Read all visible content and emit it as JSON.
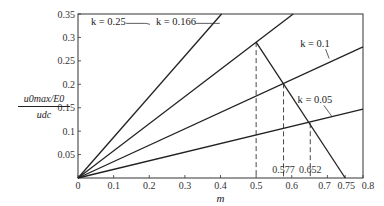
{
  "chart_data": {
    "type": "line",
    "title": "",
    "xlabel": "m",
    "ylabel": "u0max/E0 / udc",
    "ylabel_parts": {
      "numerator": "u0max/E0",
      "denominator": "udc"
    },
    "xlim": [
      0,
      0.8
    ],
    "ylim": [
      0,
      0.35
    ],
    "grid": false,
    "x_ticks": [
      0,
      0.1,
      0.2,
      0.3,
      0.4,
      0.5,
      0.6,
      0.7,
      0.75,
      0.8
    ],
    "x_tick_labels": [
      "0",
      "0.1",
      "0.2",
      "0.3",
      "0.4",
      "0.5",
      "0.6",
      "0.7",
      "0.75",
      "0.8"
    ],
    "y_ticks": [
      0.05,
      0.1,
      0.15,
      0.2,
      0.25,
      0.3,
      0.35
    ],
    "y_tick_labels": [
      "0.05",
      "0.1",
      "0.15",
      "0.2",
      "0.25",
      "0.3",
      "0.35"
    ],
    "series": [
      {
        "name": "k = 0.25",
        "x": [
          0,
          0.403
        ],
        "y": [
          0,
          0.35
        ],
        "label_pos": [
          0.17,
          0.33
        ]
      },
      {
        "name": "k = 0.166",
        "x": [
          0,
          0.604
        ],
        "y": [
          0,
          0.35
        ],
        "label_pos": [
          0.36,
          0.33
        ]
      },
      {
        "name": "k = 0.1",
        "x": [
          0,
          0.8
        ],
        "y": [
          0,
          0.28
        ],
        "label_pos": [
          0.66,
          0.3
        ]
      },
      {
        "name": "k = 0.05",
        "x": [
          0,
          0.8
        ],
        "y": [
          0,
          0.147
        ],
        "label_pos": [
          0.68,
          0.17
        ]
      },
      {
        "name": "limit",
        "x": [
          0.5,
          0.75
        ],
        "y": [
          0.29,
          0
        ]
      }
    ],
    "annotations": [
      {
        "type": "vline-dashed",
        "x": 0.5,
        "y_top": 0.29
      },
      {
        "type": "vline-dashed",
        "x": 0.577,
        "y_top": 0.202,
        "label": "0.577"
      },
      {
        "type": "vline-dashed",
        "x": 0.652,
        "y_top": 0.117,
        "label": "0.652"
      }
    ]
  }
}
